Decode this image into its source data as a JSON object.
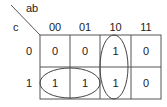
{
  "kmap": {
    "row_var": "c",
    "col_var": "ab",
    "col_headers": [
      "00",
      "01",
      "10",
      "11"
    ],
    "row_headers": [
      "0",
      "1"
    ],
    "cells": [
      [
        "0",
        "0",
        "1",
        "0"
      ],
      [
        "1",
        "1",
        "1",
        "0"
      ]
    ],
    "groups": [
      {
        "name": "vertical-group",
        "cells": [
          [
            0,
            2
          ],
          [
            1,
            2
          ]
        ]
      },
      {
        "name": "horizontal-group",
        "cells": [
          [
            1,
            0
          ],
          [
            1,
            1
          ]
        ]
      }
    ]
  }
}
